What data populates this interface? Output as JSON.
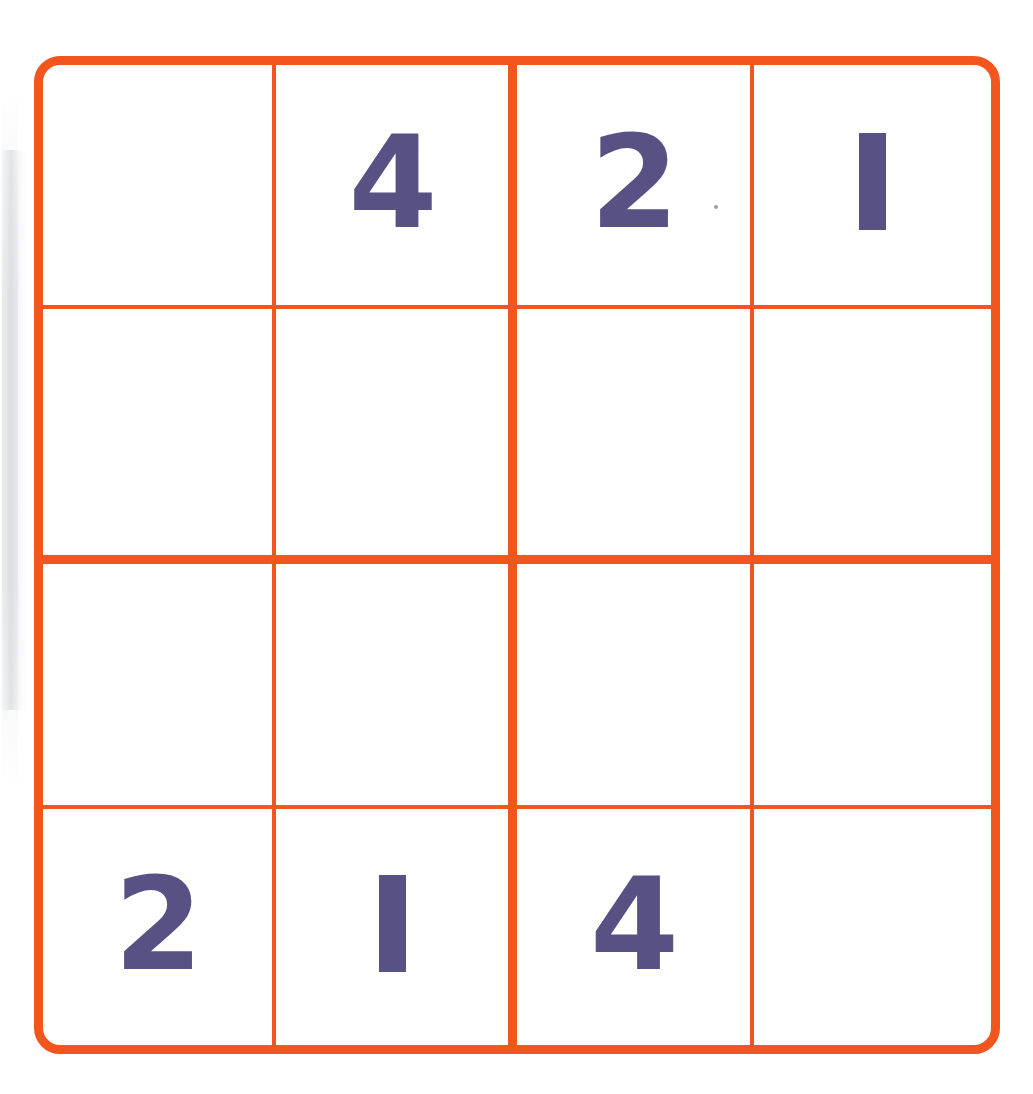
{
  "page": {
    "background_color": "#ffffff",
    "artifact_speck": {
      "visible": true,
      "x": 714,
      "y": 205,
      "color": "#8a8a94"
    }
  },
  "puzzle": {
    "kind": "sudoku",
    "size": "4x4",
    "grid_border_color": "#f2551d",
    "grid_line_color": "#f2551d",
    "digit_color": "#575184",
    "cell_background_color": "#ffffff",
    "rows": 4,
    "columns": 4,
    "box_rows": 2,
    "box_columns": 2,
    "cells": [
      [
        {
          "row": 1,
          "col": 1,
          "value": "",
          "given": false
        },
        {
          "row": 1,
          "col": 2,
          "value": "4",
          "given": true
        },
        {
          "row": 1,
          "col": 3,
          "value": "2",
          "given": true
        },
        {
          "row": 1,
          "col": 4,
          "value": "1",
          "given": true
        }
      ],
      [
        {
          "row": 2,
          "col": 1,
          "value": "",
          "given": false
        },
        {
          "row": 2,
          "col": 2,
          "value": "",
          "given": false
        },
        {
          "row": 2,
          "col": 3,
          "value": "",
          "given": false
        },
        {
          "row": 2,
          "col": 4,
          "value": "",
          "given": false
        }
      ],
      [
        {
          "row": 3,
          "col": 1,
          "value": "",
          "given": false
        },
        {
          "row": 3,
          "col": 2,
          "value": "",
          "given": false
        },
        {
          "row": 3,
          "col": 3,
          "value": "",
          "given": false
        },
        {
          "row": 3,
          "col": 4,
          "value": "",
          "given": false
        }
      ],
      [
        {
          "row": 4,
          "col": 1,
          "value": "2",
          "given": true
        },
        {
          "row": 4,
          "col": 2,
          "value": "1",
          "given": true
        },
        {
          "row": 4,
          "col": 3,
          "value": "4",
          "given": true
        },
        {
          "row": 4,
          "col": 4,
          "value": "",
          "given": false
        }
      ]
    ]
  }
}
